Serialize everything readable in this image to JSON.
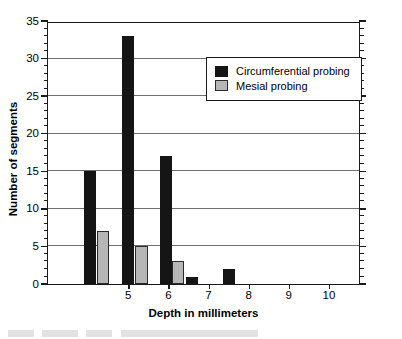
{
  "chart_data": {
    "type": "bar",
    "title": "",
    "xlabel": "Depth in millimeters",
    "ylabel": "Number of segments",
    "xlim": [
      3.0,
      10.8
    ],
    "ylim": [
      0,
      35
    ],
    "ytick_labels": [
      "0",
      "5",
      "10",
      "15",
      "20",
      "25",
      "30",
      "35"
    ],
    "ytick_values": [
      0,
      5,
      10,
      15,
      20,
      25,
      30,
      35
    ],
    "yminor_step": 1,
    "xtick_labels": [
      "5",
      "6",
      "7",
      "8",
      "9",
      "10"
    ],
    "xtick_values": [
      5,
      6,
      7,
      8,
      9,
      10
    ],
    "grid": "horizontal",
    "legend_position": "upper-right",
    "series": [
      {
        "name": "Circumferential probing",
        "color": "#151515",
        "points": [
          {
            "x": 4.05,
            "value": 15
          },
          {
            "x": 5.0,
            "value": 33
          },
          {
            "x": 5.95,
            "value": 17
          },
          {
            "x": 6.58,
            "value": 1
          },
          {
            "x": 7.52,
            "value": 2
          }
        ]
      },
      {
        "name": "Mesial probing",
        "color": "#b6b6b6",
        "points": [
          {
            "x": 4.38,
            "value": 7
          },
          {
            "x": 5.33,
            "value": 5
          },
          {
            "x": 6.25,
            "value": 3
          }
        ]
      }
    ]
  },
  "legend": {
    "items": [
      {
        "label": "Circumferential probing",
        "series": 0
      },
      {
        "label": "Mesial probing",
        "series": 1
      }
    ]
  }
}
